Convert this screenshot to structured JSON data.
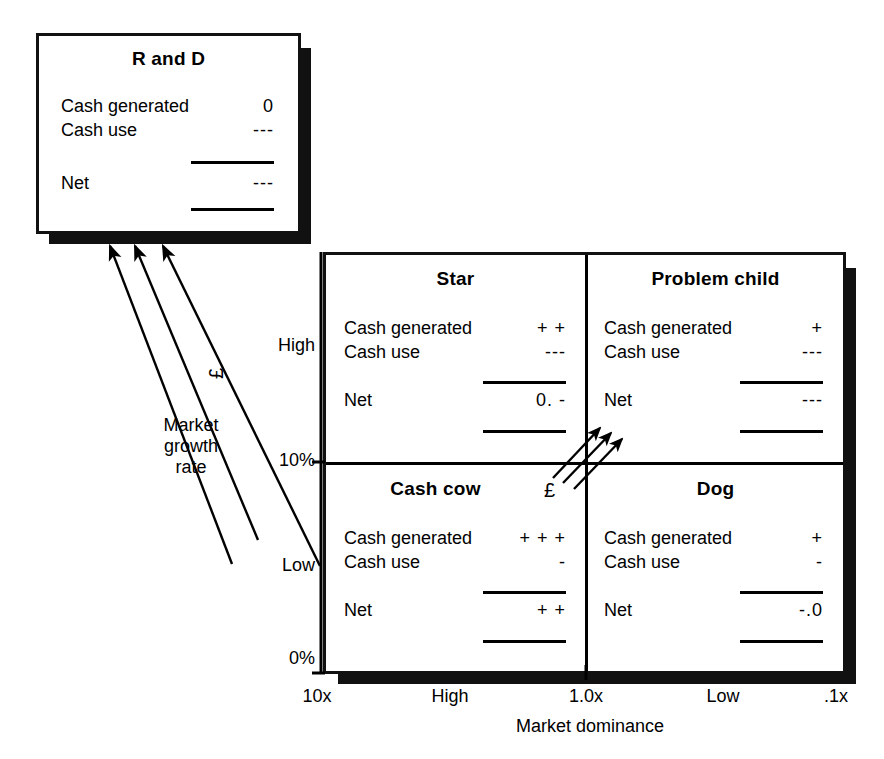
{
  "diagram": {
    "accent_color": "#000000",
    "background_color": "#ffffff"
  },
  "rd_panel": {
    "title": "R and D",
    "rows": [
      {
        "label": "Cash generated",
        "value": "0"
      },
      {
        "label": "Cash use",
        "value": "---"
      },
      {
        "label": "Net",
        "value": "---"
      }
    ]
  },
  "quadrants": {
    "star": {
      "title": "Star",
      "rows": [
        {
          "label": "Cash generated",
          "value": "+ +"
        },
        {
          "label": "Cash use",
          "value": "---"
        },
        {
          "label": "Net",
          "value": "0. -"
        }
      ]
    },
    "problem_child": {
      "title": "Problem child",
      "rows": [
        {
          "label": "Cash generated",
          "value": "+"
        },
        {
          "label": "Cash use",
          "value": "---"
        },
        {
          "label": "Net",
          "value": "---"
        }
      ]
    },
    "cash_cow": {
      "title": "Cash cow",
      "badge": "£",
      "rows": [
        {
          "label": "Cash generated",
          "value": "+ + +"
        },
        {
          "label": "Cash use",
          "value": "-"
        },
        {
          "label": "Net",
          "value": "+ +"
        }
      ]
    },
    "dog": {
      "title": "Dog",
      "rows": [
        {
          "label": "Cash generated",
          "value": "+"
        },
        {
          "label": "Cash use",
          "value": "-"
        },
        {
          "label": "Net",
          "value": "-.0"
        }
      ]
    }
  },
  "y_axis": {
    "label_lines": [
      "Market",
      "growth",
      "rate"
    ],
    "ticks": [
      {
        "text": "High"
      },
      {
        "text": "10%"
      },
      {
        "text": "Low"
      },
      {
        "text": "0%"
      }
    ]
  },
  "x_axis": {
    "label": "Market dominance",
    "ticks": [
      {
        "text": "10x"
      },
      {
        "text": "High"
      },
      {
        "text": "1.0x"
      },
      {
        "text": "Low"
      },
      {
        "text": ".1x"
      }
    ]
  },
  "flows": {
    "rd_flow_badge": "£",
    "rd_flow_count": 3,
    "internal_flow_count": 3
  }
}
